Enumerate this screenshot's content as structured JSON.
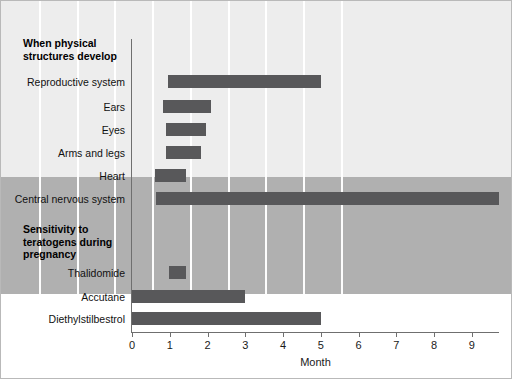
{
  "chart_data": {
    "type": "bar",
    "orientation": "horizontal",
    "title": "",
    "xlabel": "Month",
    "ylabel": "",
    "xlim": [
      0,
      9.72
    ],
    "ylim": null,
    "grid": "vertical white gridlines at each month tick",
    "legend": "none",
    "xticks": [
      "0",
      "1",
      "2",
      "3",
      "4",
      "5",
      "6",
      "7",
      "8",
      "9"
    ],
    "xtick_values": [
      0,
      1,
      2,
      3,
      4,
      5,
      6,
      7,
      8,
      9
    ],
    "sections": [
      {
        "heading": "When physical structures develop",
        "background": "#ededed",
        "rows": [
          {
            "label": "Reproductive system",
            "start": 0.95,
            "end": 5.0
          },
          {
            "label": "Ears",
            "start": 0.82,
            "end": 2.08
          },
          {
            "label": "Eyes",
            "start": 0.9,
            "end": 1.95
          },
          {
            "label": "Arms and legs",
            "start": 0.9,
            "end": 1.83
          },
          {
            "label": "Heart",
            "start": 0.6,
            "end": 1.43
          },
          {
            "label": "Central nervous system",
            "start": 0.63,
            "end": 9.72
          }
        ]
      },
      {
        "heading": "Sensitivity to teratogens during pregnancy",
        "background": "#b0b0b0",
        "rows": [
          {
            "label": "Thalidomide",
            "start": 0.97,
            "end": 1.43
          },
          {
            "label": "Accutane",
            "start": 0.0,
            "end": 3.0
          },
          {
            "label": "Diethylstilbestrol",
            "start": 0.0,
            "end": 5.0
          }
        ]
      }
    ]
  },
  "colors": {
    "bar": "#58585a",
    "panel_top": "#ededed",
    "panel_bottom": "#b0b0b0",
    "axis": "#6f6f6f",
    "gridline": "#ffffff",
    "text": "#111111",
    "frame": "#b9b9b9"
  },
  "axis": {
    "x_title": "Month"
  },
  "headings": {
    "section_1": "When physical structures develop",
    "section_2": "Sensitivity to teratogens during pregnancy"
  }
}
